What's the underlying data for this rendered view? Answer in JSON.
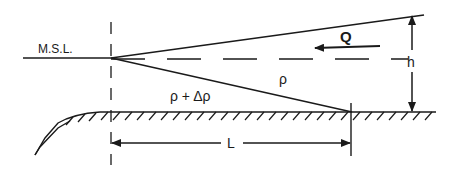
{
  "diagram": {
    "labels": {
      "msl": "M.S.L.",
      "discharge": "Q",
      "fresh_density": "ρ",
      "salt_density": "ρ + Δρ",
      "depth": "h",
      "length": "L"
    },
    "colors": {
      "line": "#1a1a1a",
      "background": "#ffffff"
    }
  }
}
